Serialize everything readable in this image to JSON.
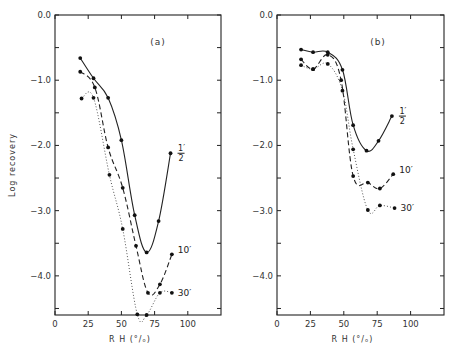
{
  "chart_data": [
    {
      "type": "line",
      "panel": "(a)",
      "xlabel": "R H (°/ₒ)",
      "ylabel": "Log recovery",
      "xlim": [
        0,
        125
      ],
      "ylim": [
        -4.6,
        0.0
      ],
      "xticks": [
        0,
        25,
        50,
        75,
        100
      ],
      "xtick_labels": [
        "0",
        "25",
        "50",
        "75",
        "100"
      ],
      "yticks": [
        0.0,
        -1.0,
        -2.0,
        -3.0,
        -4.0
      ],
      "ytick_labels": [
        "0.0",
        "-1.0",
        "-2.0",
        "-3.0",
        "-4.0"
      ],
      "series": [
        {
          "name": "1/2'",
          "label_num": "1",
          "label_den": "2",
          "style": "solid",
          "x": [
            19,
            29,
            40,
            50,
            60,
            69,
            78,
            87
          ],
          "y": [
            -0.66,
            -0.97,
            -1.27,
            -1.92,
            -3.07,
            -3.64,
            -3.16,
            -2.12
          ]
        },
        {
          "name": "10'",
          "label": "10′",
          "style": "dashed",
          "x": [
            19,
            30,
            40,
            51,
            61,
            70,
            79,
            88
          ],
          "y": [
            -0.87,
            -1.11,
            -2.03,
            -2.65,
            -3.54,
            -4.26,
            -4.13,
            -3.67
          ]
        },
        {
          "name": "30'",
          "label": "30′",
          "style": "dotted",
          "x": [
            20,
            29,
            41,
            51,
            62,
            69,
            79,
            88
          ],
          "y": [
            -1.28,
            -1.27,
            -2.45,
            -3.28,
            -4.59,
            -4.6,
            -4.26,
            -4.26
          ]
        }
      ]
    },
    {
      "type": "line",
      "panel": "(b)",
      "xlabel": "R H (°/ₒ)",
      "ylabel": "",
      "xlim": [
        0,
        125
      ],
      "ylim": [
        -4.6,
        0.0
      ],
      "xticks": [
        0,
        25,
        50,
        75,
        100
      ],
      "xtick_labels": [
        "0",
        "25",
        "50",
        "75",
        "100"
      ],
      "yticks": [
        0.0,
        -1.0,
        -2.0,
        -3.0,
        -4.0
      ],
      "ytick_labels": [
        "0.0",
        "-1.0",
        "-2.0",
        "-3.0",
        "-4.0"
      ],
      "series": [
        {
          "name": "1/2'",
          "label_num": "1",
          "label_den": "2",
          "style": "solid",
          "x": [
            18,
            27,
            38,
            49,
            57,
            67,
            76,
            86
          ],
          "y": [
            -0.53,
            -0.57,
            -0.57,
            -0.84,
            -1.69,
            -2.08,
            -1.93,
            -1.55
          ]
        },
        {
          "name": "10'",
          "label": "10′",
          "style": "dashed",
          "x": [
            18,
            27,
            38,
            48,
            57,
            68,
            77,
            87
          ],
          "y": [
            -0.68,
            -0.83,
            -0.61,
            -1.0,
            -2.47,
            -2.57,
            -2.66,
            -2.44
          ]
        },
        {
          "name": "30'",
          "label": "30′",
          "style": "dotted",
          "x": [
            18,
            27,
            38,
            49,
            57,
            68,
            77,
            88
          ],
          "y": [
            -0.77,
            -0.83,
            -0.75,
            -1.16,
            -2.06,
            -2.99,
            -2.92,
            -2.96
          ]
        }
      ]
    }
  ]
}
